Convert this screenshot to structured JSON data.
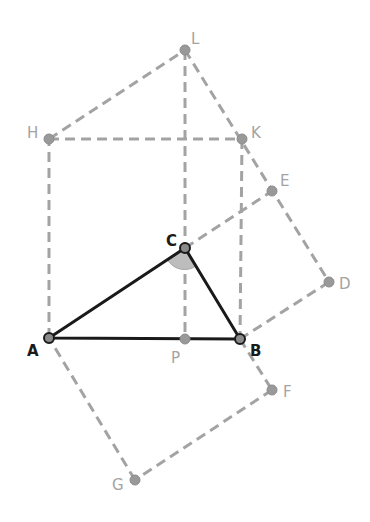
{
  "diagram": {
    "title": "",
    "colors": {
      "construction": "#a3a3a3",
      "triangle": "#1a1a1a",
      "angle_fill": "#bdbdbd",
      "background": "#ffffff"
    },
    "points": {
      "A": {
        "label": "A",
        "x": 49,
        "y": 338
      },
      "B": {
        "label": "B",
        "x": 240,
        "y": 339
      },
      "C": {
        "label": "C",
        "x": 185,
        "y": 248
      },
      "P": {
        "label": "P",
        "x": 185,
        "y": 339
      },
      "H": {
        "label": "H",
        "x": 49,
        "y": 139
      },
      "K": {
        "label": "K",
        "x": 242,
        "y": 139
      },
      "L": {
        "label": "L",
        "x": 185,
        "y": 50
      },
      "E": {
        "label": "E",
        "x": 272,
        "y": 191
      },
      "D": {
        "label": "D",
        "x": 329,
        "y": 282
      },
      "F": {
        "label": "F",
        "x": 272,
        "y": 390
      },
      "G": {
        "label": "G",
        "x": 135,
        "y": 480
      }
    },
    "triangle": [
      "A",
      "B",
      "C"
    ],
    "dashed_segments": [
      [
        "A",
        "H"
      ],
      [
        "H",
        "K"
      ],
      [
        "K",
        "B"
      ],
      [
        "H",
        "L"
      ],
      [
        "L",
        "K"
      ],
      [
        "L",
        "P"
      ],
      [
        "C",
        "E"
      ],
      [
        "L",
        "D"
      ],
      [
        "D",
        "B"
      ],
      [
        "B",
        "F"
      ],
      [
        "F",
        "G"
      ],
      [
        "G",
        "A"
      ]
    ],
    "right_angle_marker": {
      "at": "C",
      "label": ""
    }
  }
}
